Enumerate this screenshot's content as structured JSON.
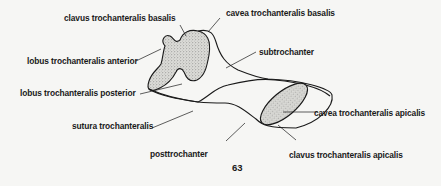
{
  "figure": {
    "labels": {
      "clavus_basalis": "clavus trochanteralis basalis",
      "cavea_basalis": "cavea trochanteralis basalis",
      "subtrochanter": "subtrochanter",
      "lobus_anterior": "lobus trochanteralis anterior",
      "lobus_posterior": "lobus trochanteralis posterior",
      "sutura": "sutura trochanteralis",
      "cavea_apicalis": "cavea trochanteralis apicalis",
      "posttrochanter": "posttrochanter",
      "clavus_apicalis": "clavus trochanteralis apicalis"
    },
    "page_number": "63"
  },
  "colors": {
    "ink": "#1a1a1a",
    "paper": "#f6f6f4",
    "stipple": "#d6d6d2"
  }
}
